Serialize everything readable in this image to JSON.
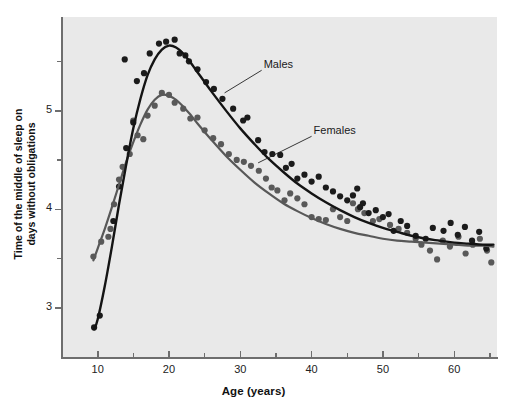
{
  "chart_data": {
    "type": "scatter",
    "title": "",
    "xlabel": "Age (years)",
    "ylabel": "Time of the middle of sleep on days without obligations",
    "ylabel_line1": "Time of the middle of sleep on",
    "ylabel_line2": "days without obligations",
    "xlim": [
      5,
      66
    ],
    "ylim": [
      2.5,
      5.95
    ],
    "xticks": [
      10,
      20,
      30,
      40,
      50,
      60
    ],
    "xticklabels": [
      "10",
      "20",
      "30",
      "40",
      "50",
      "60"
    ],
    "xminorticks": [
      5,
      15,
      25,
      35,
      45,
      55,
      65
    ],
    "yticks": [
      3,
      4,
      5
    ],
    "yticklabels": [
      "3",
      "4",
      "5"
    ],
    "yminorticks": [
      3.5,
      4.5,
      5.5
    ],
    "grid": false,
    "legend_position": "inline-annotations",
    "panel_background": "#e9e9e9",
    "axis_color": "#6e6e6e",
    "annotations": [
      {
        "text": "Males",
        "x": 33.0,
        "y": 5.45,
        "leader_to_x": 27.8,
        "leader_to_y": 5.18
      },
      {
        "text": "Females",
        "x": 40.0,
        "y": 4.78,
        "leader_to_x": 32.5,
        "leader_to_y": 4.47
      }
    ],
    "series": [
      {
        "name": "Males",
        "color": "#1b1b1b",
        "curve_color": "#141414",
        "marker": "circle",
        "curve": [
          {
            "x": 9.5,
            "y": 2.78
          },
          {
            "x": 10.0,
            "y": 2.88
          },
          {
            "x": 11.0,
            "y": 3.22
          },
          {
            "x": 12.0,
            "y": 3.62
          },
          {
            "x": 13.0,
            "y": 4.05
          },
          {
            "x": 14.0,
            "y": 4.45
          },
          {
            "x": 15.0,
            "y": 4.82
          },
          {
            "x": 16.0,
            "y": 5.12
          },
          {
            "x": 17.0,
            "y": 5.36
          },
          {
            "x": 18.0,
            "y": 5.52
          },
          {
            "x": 19.0,
            "y": 5.62
          },
          {
            "x": 20.0,
            "y": 5.66
          },
          {
            "x": 21.0,
            "y": 5.64
          },
          {
            "x": 22.0,
            "y": 5.58
          },
          {
            "x": 23.0,
            "y": 5.49
          },
          {
            "x": 24.0,
            "y": 5.39
          },
          {
            "x": 25.0,
            "y": 5.29
          },
          {
            "x": 26.0,
            "y": 5.19
          },
          {
            "x": 28.0,
            "y": 5.0
          },
          {
            "x": 30.0,
            "y": 4.82
          },
          {
            "x": 32.0,
            "y": 4.66
          },
          {
            "x": 34.0,
            "y": 4.51
          },
          {
            "x": 36.0,
            "y": 4.38
          },
          {
            "x": 38.0,
            "y": 4.26
          },
          {
            "x": 40.0,
            "y": 4.16
          },
          {
            "x": 42.0,
            "y": 4.07
          },
          {
            "x": 44.0,
            "y": 3.99
          },
          {
            "x": 46.0,
            "y": 3.92
          },
          {
            "x": 48.0,
            "y": 3.86
          },
          {
            "x": 50.0,
            "y": 3.81
          },
          {
            "x": 52.0,
            "y": 3.77
          },
          {
            "x": 54.0,
            "y": 3.73
          },
          {
            "x": 56.0,
            "y": 3.7
          },
          {
            "x": 58.0,
            "y": 3.68
          },
          {
            "x": 60.0,
            "y": 3.66
          },
          {
            "x": 62.0,
            "y": 3.65
          },
          {
            "x": 64.0,
            "y": 3.64
          },
          {
            "x": 65.5,
            "y": 3.64
          }
        ],
        "points": [
          {
            "x": 9.5,
            "y": 2.8
          },
          {
            "x": 10.3,
            "y": 2.92
          },
          {
            "x": 12.2,
            "y": 3.88
          },
          {
            "x": 13.0,
            "y": 4.23
          },
          {
            "x": 13.8,
            "y": 5.52
          },
          {
            "x": 14.0,
            "y": 4.62
          },
          {
            "x": 15.0,
            "y": 4.88
          },
          {
            "x": 15.5,
            "y": 5.3
          },
          {
            "x": 16.5,
            "y": 5.38
          },
          {
            "x": 17.3,
            "y": 5.58
          },
          {
            "x": 18.6,
            "y": 5.68
          },
          {
            "x": 19.6,
            "y": 5.7
          },
          {
            "x": 20.8,
            "y": 5.72
          },
          {
            "x": 21.5,
            "y": 5.58
          },
          {
            "x": 22.3,
            "y": 5.56
          },
          {
            "x": 22.8,
            "y": 5.5
          },
          {
            "x": 24.0,
            "y": 5.42
          },
          {
            "x": 25.2,
            "y": 5.29
          },
          {
            "x": 26.3,
            "y": 5.22
          },
          {
            "x": 27.5,
            "y": 5.12
          },
          {
            "x": 29.0,
            "y": 5.02
          },
          {
            "x": 30.4,
            "y": 4.9
          },
          {
            "x": 31.0,
            "y": 4.93
          },
          {
            "x": 32.5,
            "y": 4.7
          },
          {
            "x": 33.4,
            "y": 4.58
          },
          {
            "x": 34.5,
            "y": 4.56
          },
          {
            "x": 35.6,
            "y": 4.55
          },
          {
            "x": 36.4,
            "y": 4.42
          },
          {
            "x": 37.2,
            "y": 4.46
          },
          {
            "x": 38.0,
            "y": 4.31
          },
          {
            "x": 39.0,
            "y": 4.35
          },
          {
            "x": 40.0,
            "y": 4.28
          },
          {
            "x": 41.0,
            "y": 4.33
          },
          {
            "x": 42.0,
            "y": 4.22
          },
          {
            "x": 43.0,
            "y": 4.18
          },
          {
            "x": 44.0,
            "y": 4.13
          },
          {
            "x": 45.0,
            "y": 4.09
          },
          {
            "x": 45.8,
            "y": 4.14
          },
          {
            "x": 46.4,
            "y": 4.21
          },
          {
            "x": 46.8,
            "y": 4.02
          },
          {
            "x": 47.2,
            "y": 4.06
          },
          {
            "x": 48.0,
            "y": 3.96
          },
          {
            "x": 49.0,
            "y": 3.99
          },
          {
            "x": 50.0,
            "y": 3.92
          },
          {
            "x": 50.8,
            "y": 3.95
          },
          {
            "x": 51.5,
            "y": 3.78
          },
          {
            "x": 52.5,
            "y": 3.88
          },
          {
            "x": 53.4,
            "y": 3.83
          },
          {
            "x": 54.6,
            "y": 3.73
          },
          {
            "x": 56.0,
            "y": 3.7
          },
          {
            "x": 57.0,
            "y": 3.81
          },
          {
            "x": 58.5,
            "y": 3.78
          },
          {
            "x": 59.5,
            "y": 3.86
          },
          {
            "x": 60.5,
            "y": 3.74
          },
          {
            "x": 61.5,
            "y": 3.82
          },
          {
            "x": 62.5,
            "y": 3.68
          },
          {
            "x": 63.5,
            "y": 3.77
          },
          {
            "x": 64.5,
            "y": 3.6
          }
        ]
      },
      {
        "name": "Females",
        "color": "#595959",
        "curve_color": "#585858",
        "marker": "circle",
        "curve": [
          {
            "x": 9.4,
            "y": 3.48
          },
          {
            "x": 10.0,
            "y": 3.6
          },
          {
            "x": 11.0,
            "y": 3.8
          },
          {
            "x": 12.0,
            "y": 4.02
          },
          {
            "x": 13.0,
            "y": 4.25
          },
          {
            "x": 14.0,
            "y": 4.48
          },
          {
            "x": 15.0,
            "y": 4.68
          },
          {
            "x": 16.0,
            "y": 4.86
          },
          {
            "x": 17.0,
            "y": 5.01
          },
          {
            "x": 18.0,
            "y": 5.11
          },
          {
            "x": 19.0,
            "y": 5.16
          },
          {
            "x": 20.0,
            "y": 5.15
          },
          {
            "x": 21.0,
            "y": 5.11
          },
          {
            "x": 22.0,
            "y": 5.04
          },
          {
            "x": 23.0,
            "y": 4.96
          },
          {
            "x": 24.0,
            "y": 4.87
          },
          {
            "x": 26.0,
            "y": 4.7
          },
          {
            "x": 28.0,
            "y": 4.54
          },
          {
            "x": 30.0,
            "y": 4.4
          },
          {
            "x": 32.0,
            "y": 4.27
          },
          {
            "x": 34.0,
            "y": 4.16
          },
          {
            "x": 36.0,
            "y": 4.06
          },
          {
            "x": 38.0,
            "y": 3.98
          },
          {
            "x": 40.0,
            "y": 3.91
          },
          {
            "x": 42.0,
            "y": 3.85
          },
          {
            "x": 44.0,
            "y": 3.8
          },
          {
            "x": 46.0,
            "y": 3.76
          },
          {
            "x": 48.0,
            "y": 3.73
          },
          {
            "x": 50.0,
            "y": 3.7
          },
          {
            "x": 52.0,
            "y": 3.68
          },
          {
            "x": 54.0,
            "y": 3.67
          },
          {
            "x": 56.0,
            "y": 3.66
          },
          {
            "x": 58.0,
            "y": 3.65
          },
          {
            "x": 60.0,
            "y": 3.64
          },
          {
            "x": 62.0,
            "y": 3.63
          },
          {
            "x": 64.0,
            "y": 3.63
          },
          {
            "x": 65.5,
            "y": 3.62
          }
        ],
        "points": [
          {
            "x": 9.4,
            "y": 3.52
          },
          {
            "x": 10.5,
            "y": 3.67
          },
          {
            "x": 11.5,
            "y": 3.72
          },
          {
            "x": 11.8,
            "y": 3.8
          },
          {
            "x": 12.3,
            "y": 4.05
          },
          {
            "x": 13.0,
            "y": 4.3
          },
          {
            "x": 13.5,
            "y": 4.43
          },
          {
            "x": 14.5,
            "y": 4.56
          },
          {
            "x": 15.0,
            "y": 4.9
          },
          {
            "x": 15.6,
            "y": 4.75
          },
          {
            "x": 16.4,
            "y": 4.71
          },
          {
            "x": 17.0,
            "y": 4.95
          },
          {
            "x": 18.0,
            "y": 5.05
          },
          {
            "x": 19.0,
            "y": 5.18
          },
          {
            "x": 20.0,
            "y": 5.16
          },
          {
            "x": 20.8,
            "y": 5.08
          },
          {
            "x": 22.0,
            "y": 5.02
          },
          {
            "x": 23.0,
            "y": 4.92
          },
          {
            "x": 24.0,
            "y": 4.93
          },
          {
            "x": 25.0,
            "y": 4.8
          },
          {
            "x": 26.2,
            "y": 4.72
          },
          {
            "x": 27.3,
            "y": 4.66
          },
          {
            "x": 28.4,
            "y": 4.56
          },
          {
            "x": 29.5,
            "y": 4.5
          },
          {
            "x": 30.5,
            "y": 4.48
          },
          {
            "x": 31.5,
            "y": 4.44
          },
          {
            "x": 32.6,
            "y": 4.39
          },
          {
            "x": 33.6,
            "y": 4.31
          },
          {
            "x": 34.4,
            "y": 4.22
          },
          {
            "x": 35.2,
            "y": 4.19
          },
          {
            "x": 36.2,
            "y": 4.09
          },
          {
            "x": 37.0,
            "y": 4.16
          },
          {
            "x": 38.0,
            "y": 4.11
          },
          {
            "x": 39.0,
            "y": 4.05
          },
          {
            "x": 40.0,
            "y": 3.92
          },
          {
            "x": 41.0,
            "y": 3.9
          },
          {
            "x": 42.0,
            "y": 3.89
          },
          {
            "x": 43.0,
            "y": 4.0
          },
          {
            "x": 44.0,
            "y": 3.92
          },
          {
            "x": 45.0,
            "y": 3.88
          },
          {
            "x": 45.8,
            "y": 4.06
          },
          {
            "x": 46.5,
            "y": 4.0
          },
          {
            "x": 47.4,
            "y": 3.96
          },
          {
            "x": 48.6,
            "y": 3.88
          },
          {
            "x": 49.5,
            "y": 3.9
          },
          {
            "x": 51.0,
            "y": 3.84
          },
          {
            "x": 52.2,
            "y": 3.8
          },
          {
            "x": 53.4,
            "y": 3.76
          },
          {
            "x": 54.6,
            "y": 3.7
          },
          {
            "x": 55.4,
            "y": 3.64
          },
          {
            "x": 56.6,
            "y": 3.58
          },
          {
            "x": 57.6,
            "y": 3.49
          },
          {
            "x": 58.4,
            "y": 3.68
          },
          {
            "x": 59.4,
            "y": 3.62
          },
          {
            "x": 60.6,
            "y": 3.72
          },
          {
            "x": 61.6,
            "y": 3.55
          },
          {
            "x": 62.6,
            "y": 3.64
          },
          {
            "x": 63.6,
            "y": 3.7
          },
          {
            "x": 64.6,
            "y": 3.58
          },
          {
            "x": 65.2,
            "y": 3.46
          }
        ]
      }
    ]
  }
}
